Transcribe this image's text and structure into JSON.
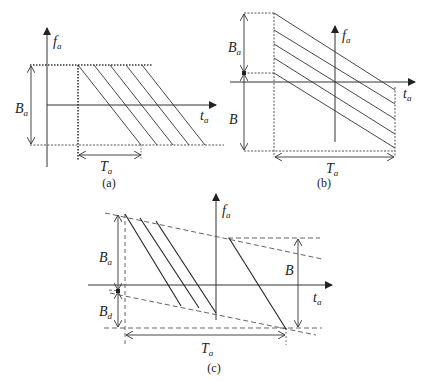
{
  "figure": {
    "panels": [
      {
        "id": "a",
        "caption": "(a)",
        "axis_vertical": {
          "label": "f",
          "sub": "a"
        },
        "axis_horizontal": {
          "label": "t",
          "sub": "a"
        },
        "bandwidth_label": {
          "label": "B",
          "sub": "a"
        },
        "duration_label": {
          "label": "T",
          "sub": "a"
        },
        "chirp_count": 5,
        "description": "Down-chirps sweeping from top dotted line to bottom dotted line, each starting at successive time offsets"
      },
      {
        "id": "b",
        "caption": "(b)",
        "axis_vertical": {
          "label": "f",
          "sub": "a"
        },
        "axis_horizontal": {
          "label": "t",
          "sub": "a"
        },
        "upper_band_label": {
          "label": "B",
          "sub": "a"
        },
        "lower_band_label": {
          "label": "B",
          "sub": ""
        },
        "duration_label": {
          "label": "T",
          "sub": "a"
        },
        "chirp_count": 5,
        "description": "Parallel down-chirps spanning duration T_a with staggered start frequencies inside B_a"
      },
      {
        "id": "c",
        "caption": "(c)",
        "axis_vertical": {
          "label": "f",
          "sub": "a"
        },
        "axis_horizontal": {
          "label": "t",
          "sub": "a"
        },
        "upper_band_label": {
          "label": "B",
          "sub": "a"
        },
        "lower_band_label": {
          "label": "B",
          "sub": "d"
        },
        "right_band_label": {
          "label": "B",
          "sub": ""
        },
        "duration_label": {
          "label": "T",
          "sub": "a"
        },
        "chirp_count": 4,
        "description": "Steep chirps bounded by two converging dashed envelope lines"
      }
    ]
  }
}
